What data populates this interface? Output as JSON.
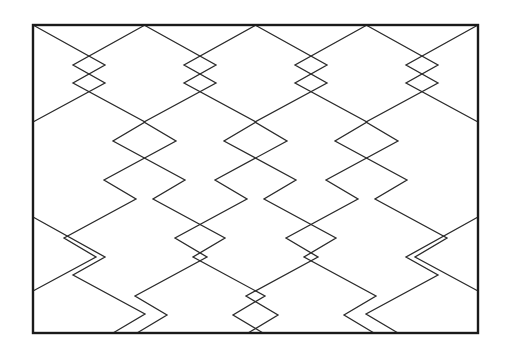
{
  "figure": {
    "title": "Zigzag lattice line figure",
    "kind": "line-drawing",
    "canvas": {
      "width": 515,
      "height": 356,
      "background": "#ffffff"
    },
    "frame": {
      "name": "border-rectangle",
      "x": 33,
      "y": 25,
      "width": 445,
      "height": 308,
      "stroke": "#1a1a1a",
      "stroke_width": 2.4,
      "fill": "none"
    },
    "style": {
      "line_color": "#2b2b2b",
      "line_width": 1.3,
      "line_cap": "butt",
      "line_join": "miter"
    },
    "geometry_notes": {
      "horizontal_period": 111,
      "vertical_period": 96,
      "zig_notch_dx": 32,
      "zig_notch_dy": 19,
      "families": 2,
      "description": "Two mirrored families of descending zigzag polylines clipped to the rectangle; crossings form X shapes."
    },
    "paths": [
      {
        "name": "zigzag-down-right-1",
        "family": "down-right",
        "points": "33,25 105,65 73,83 145,122 113,141 185,180 153,199 225,238 193,257 265,296 233,315 263,333"
      },
      {
        "name": "zigzag-down-right-2",
        "family": "down-right",
        "points": "33,217 105,257 73,275 145,314 113,333"
      },
      {
        "name": "zigzag-down-right-3",
        "family": "down-right",
        "points": "144,25 216,65 184,83 256,122 224,141 296,180 264,199 336,238 304,257 376,296 344,315 374,333"
      },
      {
        "name": "zigzag-down-right-4",
        "family": "down-right",
        "points": "255,25 327,65 295,83 367,122 335,141 407,180 375,199 447,238 415,257 478,291"
      },
      {
        "name": "zigzag-down-right-5",
        "family": "down-right",
        "points": "366,25 438,65 406,83 478,122"
      },
      {
        "name": "zigzag-down-right-6",
        "family": "down-right",
        "points": "477,25 478,25"
      },
      {
        "name": "zigzag-down-left-1",
        "family": "down-left",
        "points": "478,25 406,65 438,83 366,122 398,141 326,180 358,199 286,238 318,257 246,296 278,315 248,333"
      },
      {
        "name": "zigzag-down-left-2",
        "family": "down-left",
        "points": "478,217 406,257 438,275 366,314 398,333"
      },
      {
        "name": "zigzag-down-left-3",
        "family": "down-left",
        "points": "367,25 295,65 327,83 255,122 287,141 215,180 247,199 175,238 207,257 135,296 167,315 137,333"
      },
      {
        "name": "zigzag-down-left-4",
        "family": "down-left",
        "points": "256,25 184,65 216,83 144,122 176,141 104,180 136,199 64,238 96,257 33,291"
      },
      {
        "name": "zigzag-down-left-5",
        "family": "down-left",
        "points": "145,25 73,65 105,83 33,122"
      }
    ],
    "vertices_of_interest": [
      {
        "name": "top-left-corner",
        "x": 33,
        "y": 25
      },
      {
        "name": "top-peak-center-left",
        "x": 145,
        "y": 25
      },
      {
        "name": "top-peak-center",
        "x": 256,
        "y": 25
      },
      {
        "name": "top-peak-center-right",
        "x": 367,
        "y": 25
      },
      {
        "name": "top-right-corner",
        "x": 478,
        "y": 25
      },
      {
        "name": "left-edge-vertex",
        "x": 33,
        "y": 217
      },
      {
        "name": "right-edge-vertex",
        "x": 478,
        "y": 215
      },
      {
        "name": "crossing-upper-left",
        "x": 143,
        "y": 120
      },
      {
        "name": "crossing-upper-right",
        "x": 365,
        "y": 120
      },
      {
        "name": "crossing-center",
        "x": 257,
        "y": 215
      },
      {
        "name": "crossing-lower-left",
        "x": 140,
        "y": 315
      },
      {
        "name": "crossing-lower-right",
        "x": 370,
        "y": 315
      },
      {
        "name": "bottom-left-corner",
        "x": 33,
        "y": 333
      },
      {
        "name": "bottom-right-corner",
        "x": 478,
        "y": 333
      }
    ]
  }
}
